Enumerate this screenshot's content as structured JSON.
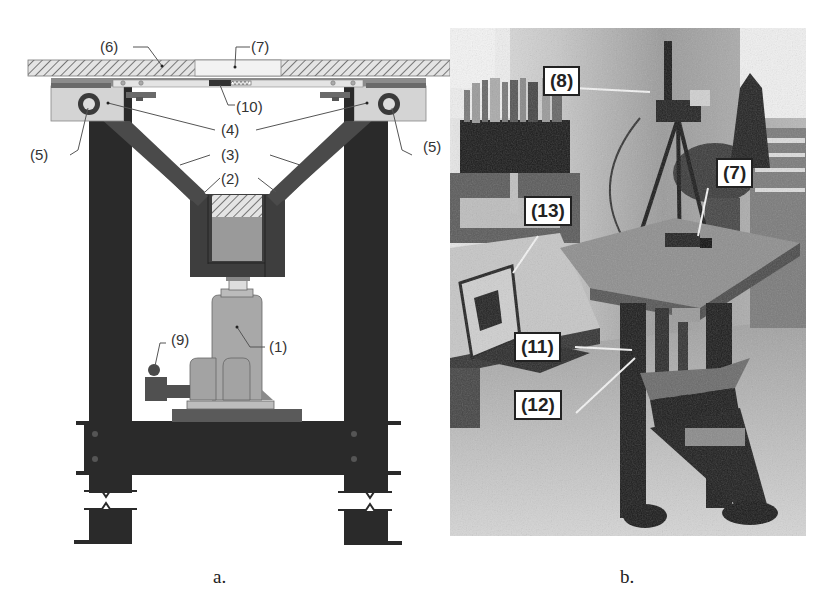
{
  "figure": {
    "panel_a": {
      "caption": "a.",
      "labels": {
        "l1": "(1)",
        "l2": "(2)",
        "l3": "(3)",
        "l4": "(4)",
        "l5_left": "(5)",
        "l5_right": "(5)",
        "l6": "(6)",
        "l7": "(7)",
        "l9": "(9)",
        "l10": "(10)"
      },
      "colors": {
        "frame": "#2a2a2a",
        "arm": "#4a4a4a",
        "jack": "#9e9e9e",
        "plate_light": "#d6d6d6",
        "hatch": "#777777"
      }
    },
    "panel_b": {
      "caption": "b.",
      "callouts": {
        "c8": "(8)",
        "c7": "(7)",
        "c13": "(13)",
        "c11": "(11)",
        "c12": "(12)"
      }
    }
  }
}
